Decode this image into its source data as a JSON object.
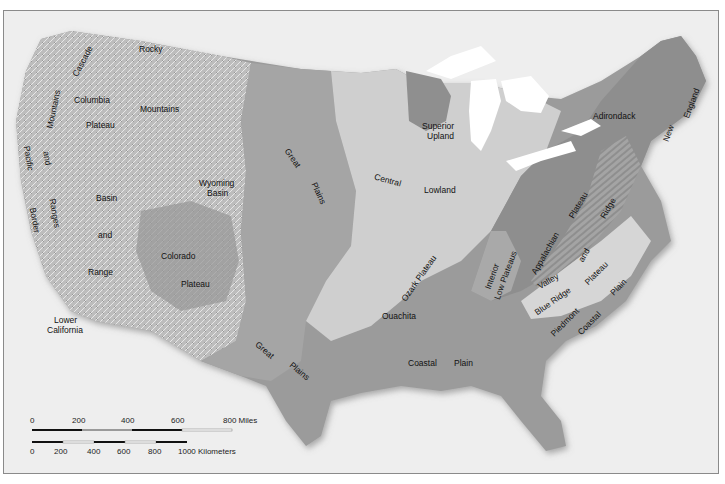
{
  "map": {
    "title": "Physiographic provinces of the conterminous United States",
    "colors": {
      "background": "#eeeeee",
      "frame_border": "#8a8a8a",
      "mountain_relief": "#b9b9b9",
      "great_plains": "#a3a3a3",
      "central_lowland": "#cfcfcf",
      "coastal_plain": "#999999",
      "appalachian_plateau": "#8e8e8e",
      "piedmont": "#d6d6d6",
      "superior_upland": "#8f8f8f",
      "great_lakes": "#ffffff",
      "label_text": "#111111"
    },
    "labels": {
      "rocky": "Rocky",
      "mountains": "Mountains",
      "columbia": "Columbia",
      "columbia_plateau": "Plateau",
      "cascade_mountains": "Mountains",
      "cascade_top": "Cascade",
      "pacific": "Pacific",
      "and_pb": "and",
      "ranges": "Ranges",
      "border": "Border",
      "basin": "Basin",
      "and_br": "and",
      "range": "Range",
      "wyoming": "Wyoming",
      "wyoming_basin": "Basin",
      "colorado": "Colorado",
      "colorado_plateau": "Plateau",
      "lower": "Lower",
      "california": "California",
      "great_n": "Great",
      "plains_n": "Plains",
      "great_s": "Great",
      "plains_s": "Plains",
      "central": "Central",
      "lowland": "Lowland",
      "superior": "Superior",
      "upland": "Upland",
      "ozark_plateau": "Ozark Plateau",
      "ouachita": "Ouachita",
      "coastal_gulf": "Coastal",
      "plain_gulf": "Plain",
      "interior": "Interior",
      "low_plateaus": "Low Plateaus",
      "appalachian": "Appalachian",
      "plateau_app": "Plateau",
      "valley": "Valley",
      "and_vr": "and",
      "ridge": "Ridge",
      "blue_ridge": "Blue Ridge",
      "piedmont": "Piedmont",
      "plateau_pied": "Plateau",
      "coastal_atl": "Coastal",
      "plain_atl": "Plain",
      "adirondack": "Adirondack",
      "new": "New",
      "england": "England"
    },
    "scale_bar": {
      "miles_ticks": [
        "0",
        "200",
        "400",
        "600",
        "800 Miles"
      ],
      "km_ticks": [
        "0",
        "200",
        "400",
        "600",
        "800",
        "1000 Kilometers"
      ]
    }
  }
}
